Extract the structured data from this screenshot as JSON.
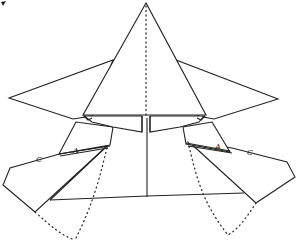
{
  "diagram": {
    "type": "folding-diagram",
    "colors": {
      "line": "#222222",
      "background": "#ffffff"
    },
    "labels": {
      "left_a": "A",
      "left_c": "C",
      "right_a": "A",
      "right_c": "C"
    }
  }
}
